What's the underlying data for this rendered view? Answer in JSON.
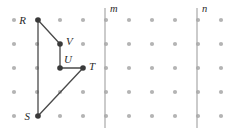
{
  "figure": {
    "canvas": {
      "width": 229,
      "height": 133,
      "background": "#ffffff"
    },
    "grid": {
      "dot_color": "#b4b4b4",
      "dot_radius": 2.1,
      "columns": 10,
      "rows": 5,
      "origin_x": 14,
      "origin_y": 20,
      "spacing_x": 23,
      "spacing_y": 24
    },
    "reference_lines": [
      {
        "id": "line-m",
        "label": "m",
        "x": 105,
        "y_top": 8,
        "y_bottom": 128,
        "label_x": 110,
        "label_y": 12,
        "color": "#a8a8a8"
      },
      {
        "id": "line-n",
        "label": "n",
        "x": 197,
        "y_top": 8,
        "y_bottom": 128,
        "label_x": 202,
        "label_y": 12,
        "color": "#a8a8a8"
      }
    ],
    "points": [
      {
        "id": "point-r",
        "label": "R",
        "x": 38,
        "y": 20,
        "label_x": 26,
        "label_y": 24,
        "anchor": "end"
      },
      {
        "id": "point-v",
        "label": "V",
        "x": 60,
        "y": 44,
        "label_x": 66,
        "label_y": 45,
        "anchor": "start"
      },
      {
        "id": "point-u",
        "label": "U",
        "x": 60,
        "y": 68,
        "label_x": 64,
        "label_y": 63,
        "anchor": "start"
      },
      {
        "id": "point-t",
        "label": "T",
        "x": 83,
        "y": 68,
        "label_x": 89,
        "label_y": 70,
        "anchor": "start"
      },
      {
        "id": "point-s",
        "label": "S",
        "x": 38,
        "y": 116,
        "label_x": 30,
        "label_y": 120,
        "anchor": "end"
      }
    ],
    "edges": [
      {
        "id": "edge-rv",
        "from": "R",
        "to": "V",
        "x1": 38,
        "y1": 20,
        "x2": 60,
        "y2": 44
      },
      {
        "id": "edge-vu",
        "from": "V",
        "to": "U",
        "x1": 60,
        "y1": 44,
        "x2": 60,
        "y2": 68
      },
      {
        "id": "edge-ut",
        "from": "U",
        "to": "T",
        "x1": 60,
        "y1": 68,
        "x2": 83,
        "y2": 68
      },
      {
        "id": "edge-ts",
        "from": "T",
        "to": "S",
        "x1": 83,
        "y1": 68,
        "x2": 38,
        "y2": 116
      },
      {
        "id": "edge-sr",
        "from": "S",
        "to": "R",
        "x1": 38,
        "y1": 116,
        "x2": 38,
        "y2": 20
      }
    ],
    "colors": {
      "grid_dot": "#b4b4b4",
      "reference_line": "#a8a8a8",
      "polygon_edge": "#4a4a4a",
      "vertex": "#3a3a3a",
      "label_text": "#2b2b2b"
    }
  }
}
